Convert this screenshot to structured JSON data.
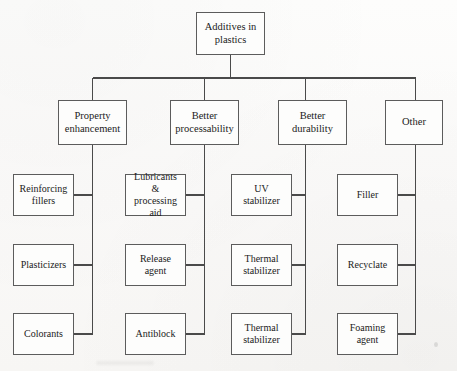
{
  "diagram": {
    "title": "Additives in plastics",
    "type": "hierarchy-tree",
    "levels": 3,
    "colors": {
      "page_background": "#fbfbfa",
      "box_fill": "#fdfdfc",
      "box_border": "#5c5c5c",
      "connector_line": "#4a4a4a",
      "text": "#1b1b1b"
    },
    "root": {
      "label": "Additives in\nplastics"
    },
    "branches": [
      {
        "id": "property-enhancement",
        "label": "Property\nenhancement",
        "leaves": [
          {
            "id": "reinforcing-fillers",
            "label": "Reinforcing\nfillers"
          },
          {
            "id": "plasticizers",
            "label": "Plasticizers"
          },
          {
            "id": "colorants",
            "label": "Colorants"
          }
        ]
      },
      {
        "id": "better-processability",
        "label": "Better\nprocessability",
        "leaves": [
          {
            "id": "lubricants-processing-aid",
            "label": "Lubricants &\nprocessing\naid"
          },
          {
            "id": "release-agent",
            "label": "Release\nagent"
          },
          {
            "id": "antiblock",
            "label": "Antiblock"
          }
        ]
      },
      {
        "id": "better-durability",
        "label": "Better\ndurability",
        "leaves": [
          {
            "id": "uv-stabilizer",
            "label": "UV stabilizer"
          },
          {
            "id": "thermal-stabilizer-1",
            "label": "Thermal\nstabilizer"
          },
          {
            "id": "thermal-stabilizer-2",
            "label": "Thermal\nstabilizer"
          }
        ]
      },
      {
        "id": "other",
        "label": "Other",
        "leaves": [
          {
            "id": "filler",
            "label": "Filler"
          },
          {
            "id": "recyclate",
            "label": "Recyclate"
          },
          {
            "id": "foaming-agent",
            "label": "Foaming\nagent"
          }
        ]
      }
    ]
  }
}
